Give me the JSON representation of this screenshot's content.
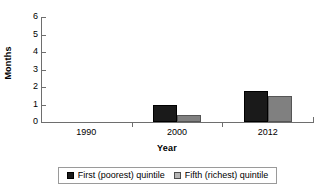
{
  "chart_data": {
    "type": "bar",
    "title": "",
    "subtitle": "",
    "xlabel": "Year",
    "ylabel": "Months",
    "categories": [
      "1990",
      "2000",
      "2012"
    ],
    "series": [
      {
        "name": "First (poorest) quintile",
        "color": "#1a1a1a",
        "values": [
          0,
          1.0,
          1.8
        ]
      },
      {
        "name": "Fifth (richest) quintile",
        "color": "#808080",
        "values": [
          0,
          0.4,
          1.5
        ]
      }
    ],
    "ylim": [
      0,
      6
    ],
    "yticks": [
      0,
      1,
      2,
      3,
      4,
      5,
      6
    ],
    "ytick_labels": [
      "0",
      "1",
      "2",
      "3",
      "4",
      "5",
      "6"
    ],
    "grid": false,
    "legend_position": "bottom"
  },
  "axis": {
    "y_title": "Months",
    "x_title": "Year"
  },
  "legend": {
    "entries": [
      {
        "label": "First (poorest) quintile",
        "swatch": "dark-square-swatch"
      },
      {
        "label": "Fifth (richest) quintile",
        "swatch": "light-square-swatch"
      }
    ]
  }
}
